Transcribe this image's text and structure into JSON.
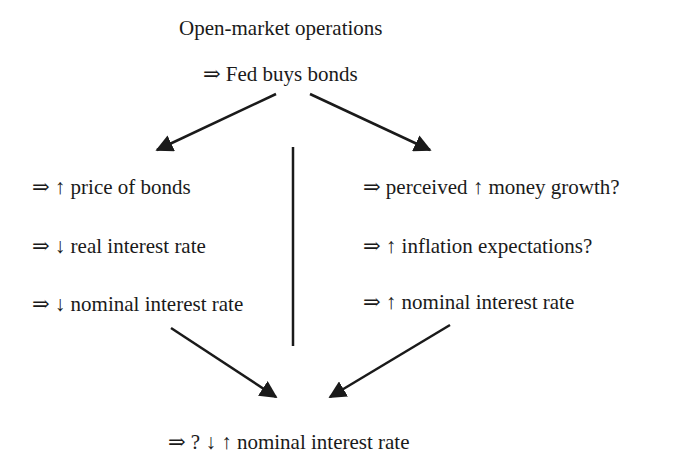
{
  "top": {
    "title": "Open-market operations",
    "step": "⇒ Fed buys bonds"
  },
  "left_branch": {
    "items": [
      "⇒ ↑ price of bonds",
      "⇒ ↓ real interest rate",
      "⇒ ↓ nominal interest rate"
    ]
  },
  "right_branch": {
    "items": [
      "⇒ perceived ↑ money growth?",
      "⇒ ↑ inflation expectations?",
      "⇒ ↑ nominal interest rate"
    ]
  },
  "result": "⇒ ? ↓ ↑ nominal interest rate",
  "colors": {
    "ink": "#1a1a1a",
    "background": "#ffffff"
  }
}
